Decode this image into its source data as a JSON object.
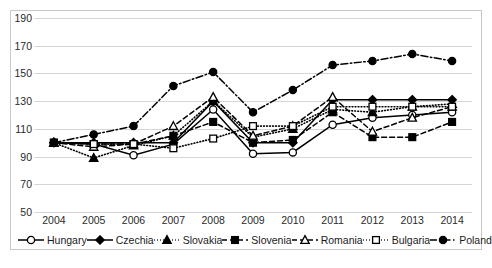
{
  "chart_data": {
    "type": "line",
    "title": "",
    "xlabel": "",
    "ylabel": "",
    "categories": [
      "2004",
      "2005",
      "2006",
      "2007",
      "2008",
      "2009",
      "2010",
      "2011",
      "2012",
      "2013",
      "2014"
    ],
    "x": [
      2004,
      2005,
      2006,
      2007,
      2008,
      2009,
      2010,
      2011,
      2012,
      2013,
      2014
    ],
    "ylim": [
      50,
      190
    ],
    "yticks": [
      50,
      70,
      90,
      110,
      130,
      150,
      170,
      190
    ],
    "grid": true,
    "legend_position": "bottom",
    "series": [
      {
        "name": "Hungary",
        "marker": "open-circle",
        "line": "solid",
        "values": [
          100,
          99,
          91,
          99,
          124,
          92,
          93,
          113,
          118,
          120,
          122
        ]
      },
      {
        "name": "Czechia",
        "marker": "filled-diamond",
        "line": "solid",
        "values": [
          100,
          100,
          100,
          100,
          130,
          100,
          100,
          131,
          131,
          131,
          131
        ]
      },
      {
        "name": "Slovakia",
        "marker": "filled-triangle",
        "line": "dotted",
        "values": [
          100,
          89,
          98,
          105,
          130,
          104,
          110,
          124,
          122,
          126,
          128
        ]
      },
      {
        "name": "Slovenia",
        "marker": "filled-square",
        "line": "dashed",
        "values": [
          100,
          99,
          99,
          105,
          115,
          100,
          102,
          122,
          104,
          104,
          115
        ]
      },
      {
        "name": "Romania",
        "marker": "open-triangle",
        "line": "dashed",
        "values": [
          100,
          97,
          99,
          112,
          133,
          105,
          112,
          133,
          108,
          118,
          126
        ]
      },
      {
        "name": "Bulgaria",
        "marker": "open-square",
        "line": "dotted",
        "values": [
          100,
          99,
          99,
          96,
          103,
          112,
          112,
          126,
          126,
          126,
          126
        ]
      },
      {
        "name": "Poland",
        "marker": "filled-circle",
        "line": "dash-dot",
        "values": [
          100,
          106,
          112,
          141,
          151,
          122,
          138,
          156,
          159,
          164,
          159
        ]
      }
    ]
  },
  "legend": {
    "items": [
      {
        "label": "Hungary",
        "key": "hungary"
      },
      {
        "label": "Czechia",
        "key": "czechia"
      },
      {
        "label": "Slovakia",
        "key": "slovakia"
      },
      {
        "label": "Slovenia",
        "key": "slovenia"
      },
      {
        "label": "Romania",
        "key": "romania"
      },
      {
        "label": "Bulgaria",
        "key": "bulgaria"
      },
      {
        "label": "Poland",
        "key": "poland"
      }
    ]
  },
  "colors": {
    "series_stroke": "#000000",
    "gridline": "#d6d6d6",
    "frame": "#c9c9c9",
    "text": "#1a1a1a",
    "background": "#ffffff"
  }
}
